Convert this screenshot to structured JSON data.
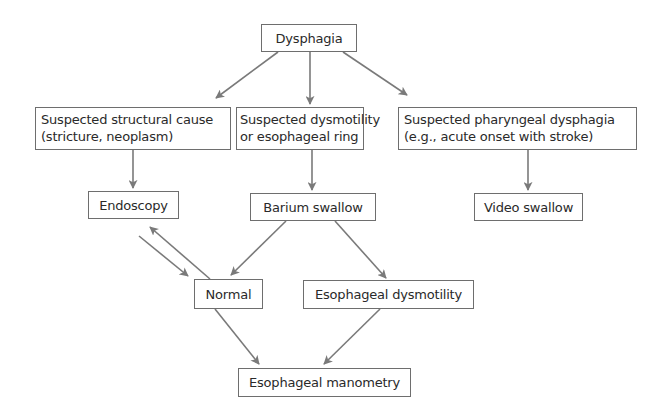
{
  "diagram": {
    "colors": {
      "arrow": "#7a7a7a",
      "box_border": "#6e6e6e",
      "text": "#2a2a2a",
      "background": "#ffffff"
    },
    "nodes": {
      "dysphagia": {
        "label": "Dysphagia"
      },
      "structural": {
        "line1": "Suspected structural cause",
        "line2": "(stricture, neoplasm)"
      },
      "dysmotility_suspected": {
        "line1": "Suspected dysmotility",
        "line2": "or esophageal ring"
      },
      "pharyngeal": {
        "line1": "Suspected pharyngeal dysphagia",
        "line2": "(e.g., acute onset with stroke)"
      },
      "endoscopy": {
        "label": "Endoscopy"
      },
      "barium": {
        "label": "Barium swallow"
      },
      "video": {
        "label": "Video swallow"
      },
      "normal": {
        "label": "Normal"
      },
      "esophageal_dysmotility": {
        "label": "Esophageal dysmotility"
      },
      "manometry": {
        "label": "Esophageal manometry"
      }
    },
    "edges": [
      {
        "from": "Dysphagia",
        "to": "Suspected structural cause"
      },
      {
        "from": "Dysphagia",
        "to": "Suspected dysmotility or esophageal ring"
      },
      {
        "from": "Dysphagia",
        "to": "Suspected pharyngeal dysphagia"
      },
      {
        "from": "Suspected structural cause",
        "to": "Endoscopy"
      },
      {
        "from": "Suspected dysmotility or esophageal ring",
        "to": "Barium swallow"
      },
      {
        "from": "Suspected pharyngeal dysphagia",
        "to": "Video swallow"
      },
      {
        "from": "Barium swallow",
        "to": "Normal"
      },
      {
        "from": "Barium swallow",
        "to": "Esophageal dysmotility"
      },
      {
        "from": "Endoscopy",
        "to": "Normal"
      },
      {
        "from": "Normal",
        "to": "Endoscopy"
      },
      {
        "from": "Normal",
        "to": "Esophageal manometry"
      },
      {
        "from": "Esophageal dysmotility",
        "to": "Esophageal manometry"
      }
    ]
  }
}
